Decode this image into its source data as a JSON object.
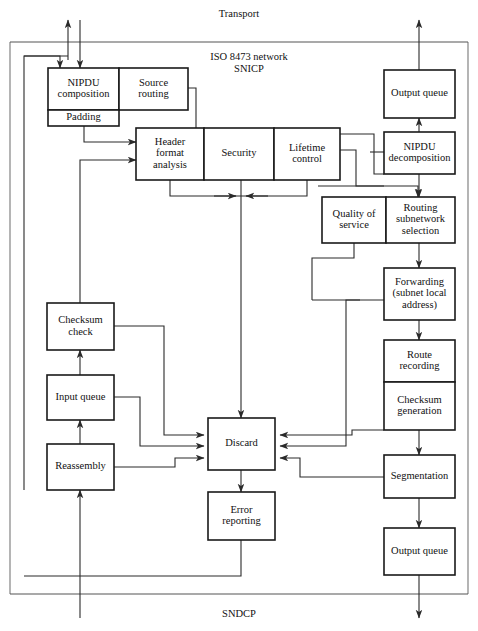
{
  "diagram": {
    "top_boundary_label": "Transport",
    "bottom_boundary_label": "SNDCP",
    "protocol_label_line1": "ISO  8473 network",
    "protocol_label_line2": "SNICP",
    "blocks": [
      {
        "id": "nipdu-composition",
        "label": "NIPDU\ncomposition",
        "lines": [
          "NIPDU",
          "composition"
        ],
        "x": 48,
        "y": 68,
        "w": 71,
        "h": 42
      },
      {
        "id": "source-routing",
        "label": "Source\nrouting",
        "lines": [
          "Source",
          "routing"
        ],
        "x": 119,
        "y": 68,
        "w": 69,
        "h": 42
      },
      {
        "id": "padding",
        "label": "Padding",
        "lines": [
          "Padding"
        ],
        "x": 48,
        "y": 110,
        "w": 71,
        "h": 16
      },
      {
        "id": "header-format-analysis",
        "label": "Header\nformat\nanalysis",
        "lines": [
          "Header",
          "format",
          "analysis"
        ],
        "x": 136,
        "y": 128,
        "w": 68,
        "h": 52
      },
      {
        "id": "security",
        "label": "Security",
        "lines": [
          "Security"
        ],
        "x": 204,
        "y": 128,
        "w": 70,
        "h": 52
      },
      {
        "id": "lifetime-control",
        "label": "Lifetime\ncontrol",
        "lines": [
          "Lifetime",
          "control"
        ],
        "x": 274,
        "y": 128,
        "w": 66,
        "h": 52
      },
      {
        "id": "quality-of-service",
        "label": "Quality of\nservice",
        "lines": [
          "Quality  of",
          "service"
        ],
        "x": 322,
        "y": 197,
        "w": 64,
        "h": 46
      },
      {
        "id": "routing-subnetwork-selection",
        "label": "Routing\nsubnetwork\nselection",
        "lines": [
          "Routing",
          "subnetwork",
          "selection"
        ],
        "x": 386,
        "y": 197,
        "w": 69,
        "h": 46
      },
      {
        "id": "output-queue-top",
        "label": "Output queue",
        "lines": [
          "Output  queue"
        ],
        "x": 384,
        "y": 70,
        "w": 71,
        "h": 48
      },
      {
        "id": "nipdu-decomposition",
        "label": "NIPDU\ndecomposition",
        "lines": [
          "NIPDU",
          "decomposition"
        ],
        "x": 384,
        "y": 132,
        "w": 71,
        "h": 42
      },
      {
        "id": "forwarding",
        "label": "Forwarding (subnet local address)",
        "lines": [
          "Forwarding",
          "(subnet  local",
          "address)"
        ],
        "x": 384,
        "y": 268,
        "w": 71,
        "h": 52
      },
      {
        "id": "route-recording",
        "label": "Route\nrecording",
        "lines": [
          "Route",
          "recording"
        ],
        "x": 384,
        "y": 340,
        "w": 71,
        "h": 42
      },
      {
        "id": "checksum-generation",
        "label": "Checksum\ngeneration",
        "lines": [
          "Checksum",
          "generation"
        ],
        "x": 384,
        "y": 382,
        "w": 71,
        "h": 48
      },
      {
        "id": "segmentation",
        "label": "Segmentation",
        "lines": [
          "Segmentation"
        ],
        "x": 384,
        "y": 455,
        "w": 71,
        "h": 43
      },
      {
        "id": "output-queue-bottom",
        "label": "Output queue",
        "lines": [
          "Output  queue"
        ],
        "x": 384,
        "y": 528,
        "w": 71,
        "h": 47
      },
      {
        "id": "checksum-check",
        "label": "Checksum\ncheck",
        "lines": [
          "Checksum",
          "check"
        ],
        "x": 47,
        "y": 303,
        "w": 67,
        "h": 47
      },
      {
        "id": "input-queue",
        "label": "Input queue",
        "lines": [
          "Input  queue"
        ],
        "x": 47,
        "y": 375,
        "w": 67,
        "h": 45
      },
      {
        "id": "reassembly",
        "label": "Reassembly",
        "lines": [
          "Reassembly"
        ],
        "x": 47,
        "y": 444,
        "w": 67,
        "h": 46
      },
      {
        "id": "discard",
        "label": "Discard",
        "lines": [
          "Discard"
        ],
        "x": 208,
        "y": 418,
        "w": 67,
        "h": 52
      },
      {
        "id": "error-reporting",
        "label": "Error\nreporting",
        "lines": [
          "Error",
          "reporting"
        ],
        "x": 208,
        "y": 492,
        "w": 67,
        "h": 48
      }
    ],
    "boundaries": {
      "top_line_y": 42,
      "bottom_line_y": 594,
      "frame_left_x": 10,
      "frame_right_x": 468,
      "frame_top_y": 42,
      "frame_bottom_y": 594
    }
  }
}
